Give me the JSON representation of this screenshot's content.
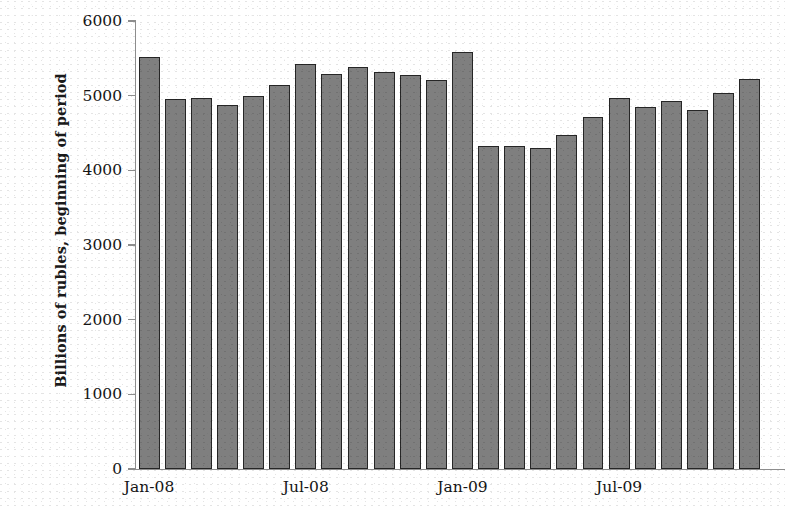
{
  "chart_data": {
    "type": "bar",
    "title": "",
    "xlabel": "",
    "ylabel": "Billions of rubles, beginning of period",
    "ylim": [
      0,
      6000
    ],
    "ytick_labels": [
      "6000",
      "5000",
      "4000",
      "3000",
      "2000",
      "1000",
      "0"
    ],
    "ytick_values": [
      6000,
      5000,
      4000,
      3000,
      2000,
      1000,
      0
    ],
    "grid": false,
    "legend": null,
    "bar_color": "#7f7f7f",
    "bar_edge_color": "#262626",
    "axis_color": "#8d8d8d",
    "xtick_labels": [
      "Jan-08",
      "Jul-08",
      "Jan-09",
      "Jul-09"
    ],
    "xtick_positions": [
      0,
      6,
      12,
      18
    ],
    "categories": [
      "Jan-08",
      "Feb-08",
      "Mar-08",
      "Apr-08",
      "May-08",
      "Jun-08",
      "Jul-08",
      "Aug-08",
      "Sep-08",
      "Oct-08",
      "Nov-08",
      "Dec-08",
      "Jan-09",
      "Feb-09",
      "Mar-09",
      "Apr-09",
      "May-09",
      "Jun-09",
      "Jul-09",
      "Aug-09",
      "Sep-09",
      "Oct-09",
      "Nov-09",
      "Dec-09"
    ],
    "values": [
      5520,
      4950,
      4970,
      4880,
      5000,
      5140,
      5430,
      5290,
      5380,
      5320,
      5280,
      5210,
      5590,
      4330,
      4330,
      4300,
      4480,
      4710,
      4970,
      4850,
      4930,
      4810,
      5030,
      5220
    ]
  }
}
